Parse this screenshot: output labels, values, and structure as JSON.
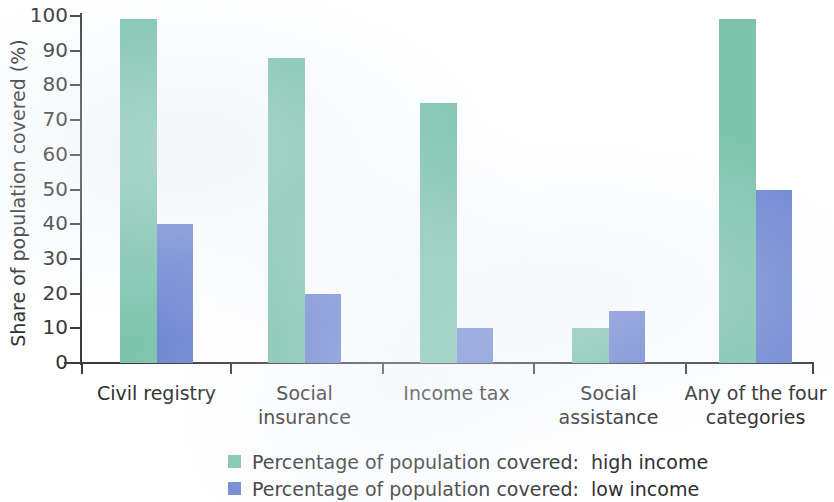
{
  "chart_data": {
    "type": "bar",
    "title": "",
    "xlabel": "",
    "ylabel": "Share of population covered (%)",
    "ylim": [
      0,
      100
    ],
    "ytick_step": 10,
    "yticks": [
      100,
      90,
      80,
      70,
      60,
      50,
      40,
      30,
      20,
      10,
      0
    ],
    "grid": false,
    "legend_position": "bottom",
    "categories": [
      "Civil registry",
      "Social\ninsurance",
      "Income tax",
      "Social\nassistance",
      "Any of the four\ncategories"
    ],
    "series": [
      {
        "name": "Percentage of population covered:  high income",
        "color": "#7ec4ad",
        "values": [
          99,
          88,
          75,
          10,
          99
        ]
      },
      {
        "name": "Percentage of population covered:  low income",
        "color": "#6f86d1",
        "values": [
          40,
          20,
          10,
          15,
          50
        ]
      }
    ]
  },
  "axis": {
    "y_title": "Share of population covered (%)",
    "tick_labels": [
      "100",
      "90",
      "80",
      "70",
      "60",
      "50",
      "40",
      "30",
      "20",
      "10",
      "0"
    ]
  },
  "categories": [
    {
      "line1": "Civil registry",
      "line2": ""
    },
    {
      "line1": "Social",
      "line2": "insurance"
    },
    {
      "line1": "Income tax",
      "line2": ""
    },
    {
      "line1": "Social",
      "line2": "assistance"
    },
    {
      "line1": "Any of the four",
      "line2": "categories"
    }
  ],
  "legend": {
    "items": [
      {
        "label": "Percentage of population covered:  high income",
        "color": "#7ec4ad"
      },
      {
        "label": "Percentage of population covered:  low income",
        "color": "#6f86d1"
      }
    ]
  },
  "colors": {
    "high_income": "#7ec4ad",
    "low_income": "#6f86d1",
    "axis": "#3b3b3b",
    "text": "#2e2e2e",
    "background": "#ffffff"
  }
}
